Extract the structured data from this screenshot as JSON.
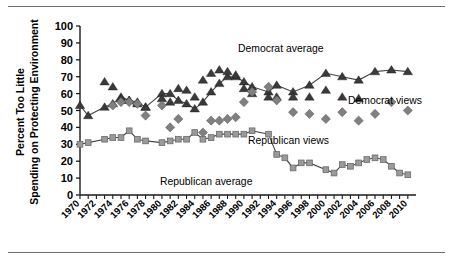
{
  "figure": {
    "title": "",
    "ylabel_line1": "Percent Too Little",
    "ylabel_line2": "Spending on Protecting Environment",
    "annotations": {
      "democrat_average": "Democrat average",
      "democrat_views": "Democrat views",
      "republican_views": "Republican views",
      "republican_average": "Republican average"
    },
    "colors": {
      "democrat_marker": "#3a3a3a",
      "republican_views_marker": "#808080",
      "republican_average_marker": "#9a9a9a",
      "line": "#444444",
      "axis": "#1a1a1a",
      "rule": "#6e6e6e"
    }
  },
  "chart_data": {
    "type": "scatter",
    "title": "",
    "xlabel": "",
    "ylabel": "Percent Too Little Spending on Protecting Environment",
    "xlim": [
      1970,
      2011
    ],
    "ylim": [
      0,
      100
    ],
    "ytick_labels": [
      "0",
      "10",
      "20",
      "30",
      "40",
      "50",
      "60",
      "70",
      "80",
      "90",
      "100"
    ],
    "yticks": [
      0,
      10,
      20,
      30,
      40,
      50,
      60,
      70,
      80,
      90,
      100
    ],
    "xtick_labels": [
      "1970",
      "1972",
      "1974",
      "1976",
      "1978",
      "1980",
      "1982",
      "1984",
      "1986",
      "1988",
      "1990",
      "1992",
      "1994",
      "1996",
      "1998",
      "2000",
      "2002",
      "2004",
      "2006",
      "2008",
      "2010"
    ],
    "xticks": [
      1970,
      1972,
      1974,
      1976,
      1978,
      1980,
      1982,
      1984,
      1986,
      1988,
      1990,
      1992,
      1994,
      1996,
      1998,
      2000,
      2002,
      2004,
      2006,
      2008,
      2010
    ],
    "minor_xticks_every": 1,
    "grid": false,
    "legend_position": "inline-annotations",
    "series": [
      {
        "name": "Democrat average",
        "marker": "triangle",
        "line": true,
        "color": "#3a3a3a",
        "points": [
          {
            "x": 1970,
            "y": 53
          },
          {
            "x": 1971,
            "y": 47
          },
          {
            "x": 1973,
            "y": 52
          },
          {
            "x": 1974,
            "y": 54
          },
          {
            "x": 1975,
            "y": 58
          },
          {
            "x": 1976,
            "y": 56
          },
          {
            "x": 1977,
            "y": 55
          },
          {
            "x": 1978,
            "y": 52
          },
          {
            "x": 1980,
            "y": 60
          },
          {
            "x": 1981,
            "y": 60
          },
          {
            "x": 1982,
            "y": 56
          },
          {
            "x": 1983,
            "y": 54
          },
          {
            "x": 1984,
            "y": 51
          },
          {
            "x": 1985,
            "y": 55
          },
          {
            "x": 1986,
            "y": 61
          },
          {
            "x": 1987,
            "y": 66
          },
          {
            "x": 1988,
            "y": 70
          },
          {
            "x": 1989,
            "y": 70
          },
          {
            "x": 1990,
            "y": 67
          },
          {
            "x": 1991,
            "y": 64
          },
          {
            "x": 1993,
            "y": 61
          },
          {
            "x": 1994,
            "y": 65
          },
          {
            "x": 1996,
            "y": 61
          },
          {
            "x": 1998,
            "y": 65
          },
          {
            "x": 2000,
            "y": 72
          },
          {
            "x": 2002,
            "y": 70
          },
          {
            "x": 2004,
            "y": 68
          },
          {
            "x": 2006,
            "y": 73
          },
          {
            "x": 2008,
            "y": 74
          },
          {
            "x": 2010,
            "y": 73
          }
        ]
      },
      {
        "name": "Democrat views",
        "marker": "triangle",
        "line": false,
        "color": "#3a3a3a",
        "points": [
          {
            "x": 1973,
            "y": 67
          },
          {
            "x": 1974,
            "y": 64
          },
          {
            "x": 1975,
            "y": 57
          },
          {
            "x": 1976,
            "y": 56
          },
          {
            "x": 1977,
            "y": 54
          },
          {
            "x": 1978,
            "y": 52
          },
          {
            "x": 1980,
            "y": 57
          },
          {
            "x": 1981,
            "y": 55
          },
          {
            "x": 1982,
            "y": 63
          },
          {
            "x": 1983,
            "y": 62
          },
          {
            "x": 1984,
            "y": 58
          },
          {
            "x": 1985,
            "y": 68
          },
          {
            "x": 1986,
            "y": 72
          },
          {
            "x": 1987,
            "y": 74
          },
          {
            "x": 1988,
            "y": 73
          },
          {
            "x": 1989,
            "y": 71
          },
          {
            "x": 1990,
            "y": 63
          },
          {
            "x": 1991,
            "y": 60
          },
          {
            "x": 1993,
            "y": 58
          },
          {
            "x": 1994,
            "y": 58
          },
          {
            "x": 1996,
            "y": 58
          },
          {
            "x": 1998,
            "y": 58
          },
          {
            "x": 2000,
            "y": 62
          },
          {
            "x": 2002,
            "y": 58
          },
          {
            "x": 2004,
            "y": 57
          }
        ]
      },
      {
        "name": "Republican views",
        "marker": "diamond",
        "line": false,
        "color": "#808080",
        "points": [
          {
            "x": 1974,
            "y": 53
          },
          {
            "x": 1975,
            "y": 55
          },
          {
            "x": 1976,
            "y": 55
          },
          {
            "x": 1977,
            "y": 54
          },
          {
            "x": 1978,
            "y": 47
          },
          {
            "x": 1980,
            "y": 53
          },
          {
            "x": 1981,
            "y": 40
          },
          {
            "x": 1982,
            "y": 45
          },
          {
            "x": 1985,
            "y": 37
          },
          {
            "x": 1986,
            "y": 44
          },
          {
            "x": 1987,
            "y": 44
          },
          {
            "x": 1988,
            "y": 45
          },
          {
            "x": 1989,
            "y": 46
          },
          {
            "x": 1990,
            "y": 55
          },
          {
            "x": 1991,
            "y": 61
          },
          {
            "x": 1993,
            "y": 64
          },
          {
            "x": 1994,
            "y": 56
          },
          {
            "x": 1996,
            "y": 49
          },
          {
            "x": 1998,
            "y": 48
          },
          {
            "x": 2000,
            "y": 45
          },
          {
            "x": 2002,
            "y": 49
          },
          {
            "x": 2004,
            "y": 44
          },
          {
            "x": 2006,
            "y": 48
          },
          {
            "x": 2008,
            "y": 55
          },
          {
            "x": 2010,
            "y": 50
          }
        ]
      },
      {
        "name": "Republican average",
        "marker": "square",
        "line": true,
        "color": "#9a9a9a",
        "points": [
          {
            "x": 1970,
            "y": 30
          },
          {
            "x": 1971,
            "y": 31
          },
          {
            "x": 1973,
            "y": 33
          },
          {
            "x": 1974,
            "y": 34
          },
          {
            "x": 1975,
            "y": 34
          },
          {
            "x": 1976,
            "y": 38
          },
          {
            "x": 1977,
            "y": 33
          },
          {
            "x": 1978,
            "y": 32
          },
          {
            "x": 1980,
            "y": 31
          },
          {
            "x": 1981,
            "y": 32
          },
          {
            "x": 1982,
            "y": 33
          },
          {
            "x": 1983,
            "y": 33
          },
          {
            "x": 1984,
            "y": 37
          },
          {
            "x": 1985,
            "y": 33
          },
          {
            "x": 1986,
            "y": 34
          },
          {
            "x": 1987,
            "y": 36
          },
          {
            "x": 1988,
            "y": 36
          },
          {
            "x": 1989,
            "y": 36
          },
          {
            "x": 1990,
            "y": 36
          },
          {
            "x": 1991,
            "y": 38
          },
          {
            "x": 1993,
            "y": 36
          },
          {
            "x": 1994,
            "y": 24
          },
          {
            "x": 1995,
            "y": 22
          },
          {
            "x": 1996,
            "y": 16
          },
          {
            "x": 1997,
            "y": 19
          },
          {
            "x": 1998,
            "y": 19
          },
          {
            "x": 2000,
            "y": 15
          },
          {
            "x": 2001,
            "y": 13
          },
          {
            "x": 2002,
            "y": 18
          },
          {
            "x": 2003,
            "y": 17
          },
          {
            "x": 2004,
            "y": 19
          },
          {
            "x": 2005,
            "y": 21
          },
          {
            "x": 2006,
            "y": 22
          },
          {
            "x": 2007,
            "y": 21
          },
          {
            "x": 2008,
            "y": 17
          },
          {
            "x": 2009,
            "y": 13
          },
          {
            "x": 2010,
            "y": 12
          }
        ]
      }
    ]
  }
}
